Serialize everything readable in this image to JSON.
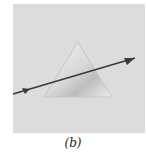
{
  "figure": {
    "caption": "(b)",
    "panel_color": "#dcdcdc",
    "prism": {
      "shape": "triangle",
      "fill": "#e8e8e8",
      "edge": "#c8c8c8"
    },
    "ray": {
      "color": "#3a3a3a",
      "direction": "left-to-right upward",
      "arrowheads": 2
    }
  }
}
